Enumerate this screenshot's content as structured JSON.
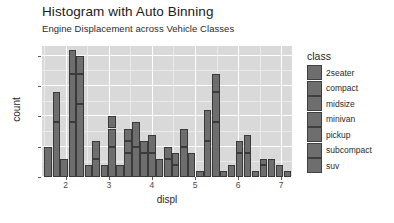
{
  "header": {
    "title": "Histogram with Auto Binning",
    "subtitle": "Engine Displacement across Vehicle Classes"
  },
  "legend": {
    "title": "class",
    "items": [
      {
        "label": "2seater",
        "color": "#6e6e6e"
      },
      {
        "label": "compact",
        "color": "#6e6e6e"
      },
      {
        "label": "midsize",
        "color": "#6e6e6e"
      },
      {
        "label": "minivan",
        "color": "#6e6e6e"
      },
      {
        "label": "pickup",
        "color": "#6e6e6e"
      },
      {
        "label": "subcompact",
        "color": "#6e6e6e"
      },
      {
        "label": "suv",
        "color": "#6e6e6e"
      }
    ]
  },
  "axes": {
    "x": {
      "label": "displ",
      "ticks": [
        "2",
        "3",
        "4",
        "5",
        "6",
        "7"
      ],
      "tick_values": [
        2,
        3,
        4,
        5,
        6,
        7
      ],
      "range": [
        1.45,
        7.25
      ]
    },
    "y": {
      "label": "count",
      "ticks": [
        "0",
        "5",
        "10",
        "15",
        "20"
      ],
      "tick_values": [
        0,
        5,
        10,
        15,
        20
      ],
      "range": [
        0,
        21.6
      ]
    }
  },
  "style": {
    "panel_background": "#d9d9d9",
    "grid_color": "#ffffff",
    "bar_fill": "#6e6e6e",
    "bar_stroke": "#3a3a3a",
    "page_background": "#ffffff"
  },
  "chart_data": {
    "type": "bar",
    "title": "Histogram with Auto Binning",
    "subtitle": "Engine Displacement across Vehicle Classes",
    "xlabel": "displ",
    "ylabel": "count",
    "xlim": [
      1.45,
      7.25
    ],
    "ylim": [
      0,
      21.6
    ],
    "grid": true,
    "legend_position": "right",
    "legend_title": "class",
    "stacked": true,
    "bin_width": 0.185,
    "bins": [
      {
        "x": 1.6,
        "count": 5,
        "segments": [
          5
        ]
      },
      {
        "x": 1.79,
        "count": 14,
        "segments": [
          9,
          5
        ]
      },
      {
        "x": 1.97,
        "count": 3,
        "segments": [
          3
        ]
      },
      {
        "x": 2.16,
        "count": 21,
        "segments": [
          9,
          8,
          4
        ]
      },
      {
        "x": 2.34,
        "count": 20,
        "segments": [
          12,
          5,
          3
        ]
      },
      {
        "x": 2.53,
        "count": 2,
        "segments": [
          2
        ]
      },
      {
        "x": 2.71,
        "count": 6,
        "segments": [
          3,
          3
        ]
      },
      {
        "x": 2.9,
        "count": 2,
        "segments": [
          2
        ]
      },
      {
        "x": 3.08,
        "count": 10,
        "segments": [
          5,
          3,
          2
        ]
      },
      {
        "x": 3.27,
        "count": 2,
        "segments": [
          2
        ]
      },
      {
        "x": 3.45,
        "count": 8,
        "segments": [
          4,
          2,
          2
        ]
      },
      {
        "x": 3.64,
        "count": 9,
        "segments": [
          5,
          4
        ]
      },
      {
        "x": 3.82,
        "count": 6,
        "segments": [
          4,
          2
        ]
      },
      {
        "x": 4.01,
        "count": 7,
        "segments": [
          4,
          3
        ]
      },
      {
        "x": 4.19,
        "count": 3,
        "segments": [
          3
        ]
      },
      {
        "x": 4.38,
        "count": 5,
        "segments": [
          3,
          2
        ]
      },
      {
        "x": 4.56,
        "count": 4,
        "segments": [
          2,
          2
        ]
      },
      {
        "x": 4.75,
        "count": 8,
        "segments": [
          5,
          3
        ]
      },
      {
        "x": 4.93,
        "count": 4,
        "segments": [
          4
        ]
      },
      {
        "x": 5.12,
        "count": 1,
        "segments": [
          1
        ]
      },
      {
        "x": 5.3,
        "count": 11,
        "segments": [
          6,
          5
        ]
      },
      {
        "x": 5.49,
        "count": 17,
        "segments": [
          9,
          5,
          3
        ]
      },
      {
        "x": 5.67,
        "count": 1,
        "segments": [
          1
        ]
      },
      {
        "x": 5.86,
        "count": 2,
        "segments": [
          2
        ]
      },
      {
        "x": 6.04,
        "count": 6,
        "segments": [
          4,
          2
        ]
      },
      {
        "x": 6.23,
        "count": 7,
        "segments": [
          4,
          3
        ]
      },
      {
        "x": 6.41,
        "count": 1,
        "segments": [
          1
        ]
      },
      {
        "x": 6.6,
        "count": 3,
        "segments": [
          2,
          1
        ]
      },
      {
        "x": 6.78,
        "count": 3,
        "segments": [
          3
        ]
      },
      {
        "x": 6.97,
        "count": 2,
        "segments": [
          2
        ]
      },
      {
        "x": 7.15,
        "count": 1,
        "segments": [
          1
        ]
      }
    ]
  }
}
